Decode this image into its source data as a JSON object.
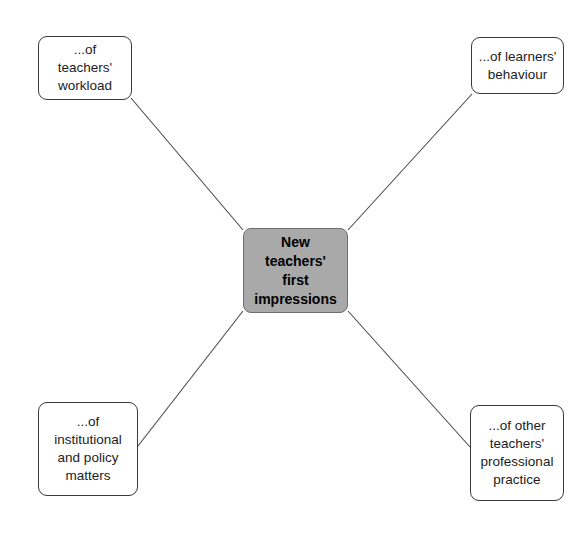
{
  "diagram": {
    "type": "spider-mind-map",
    "background_color": "#ffffff",
    "center": {
      "id": "center",
      "label": "New\nteachers'\nfirst\nimpressions",
      "lines": [
        "New",
        "teachers'",
        "first",
        "impressions"
      ],
      "fill_color": "#a9a9a9",
      "border_color": "#6e6e6e",
      "text_color": "#000000",
      "bold": true
    },
    "nodes": [
      {
        "id": "top-left",
        "label": "...of\nteachers'\nworkload",
        "lines": [
          "...of",
          "teachers'",
          "workload"
        ],
        "fill_color": "#ffffff",
        "border_color": "#3a3a3a",
        "text_color": "#1c1c1c"
      },
      {
        "id": "top-right",
        "label": "...of learners'\nbehaviour",
        "lines": [
          "...of learners'",
          "behaviour"
        ],
        "fill_color": "#ffffff",
        "border_color": "#3a3a3a",
        "text_color": "#1c1c1c"
      },
      {
        "id": "bottom-left",
        "label": "...of\ninstitutional\nand policy\nmatters",
        "lines": [
          "...of",
          "institutional",
          "and policy",
          "matters"
        ],
        "fill_color": "#ffffff",
        "border_color": "#3a3a3a",
        "text_color": "#1c1c1c"
      },
      {
        "id": "bottom-right",
        "label": "...of other\nteachers'\nprofessional\npractice",
        "lines": [
          "...of other",
          "teachers'",
          "professional",
          "practice"
        ],
        "fill_color": "#ffffff",
        "border_color": "#3a3a3a",
        "text_color": "#1c1c1c"
      }
    ],
    "connectors": [
      {
        "id": "center-to-top-left",
        "from": "center",
        "to": "top-left",
        "x1": 243,
        "y1": 230,
        "x2": 131,
        "y2": 98,
        "color": "#4a4a4a"
      },
      {
        "id": "center-to-top-right",
        "from": "center",
        "to": "top-right",
        "x1": 348,
        "y1": 230,
        "x2": 472,
        "y2": 94,
        "color": "#4a4a4a"
      },
      {
        "id": "center-to-bottom-left",
        "from": "center",
        "to": "bottom-left",
        "x1": 243,
        "y1": 311,
        "x2": 138,
        "y2": 446,
        "color": "#4a4a4a"
      },
      {
        "id": "center-to-bottom-right",
        "from": "center",
        "to": "bottom-right",
        "x1": 348,
        "y1": 311,
        "x2": 470,
        "y2": 447,
        "color": "#4a4a4a"
      }
    ]
  }
}
